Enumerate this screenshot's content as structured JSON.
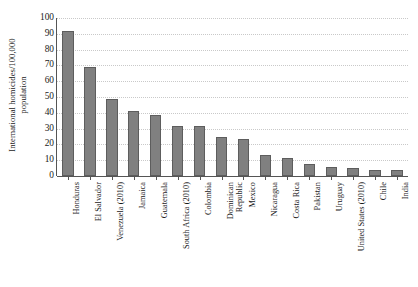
{
  "chart_data": {
    "type": "bar",
    "title": "",
    "subtitle": "",
    "xlabel": "",
    "ylabel": "International homicides/100,000 population",
    "ylabel_lines": [
      "International homicides/100,000",
      "population"
    ],
    "ylim": [
      0,
      100
    ],
    "yticks": [
      0,
      10,
      20,
      30,
      40,
      50,
      60,
      70,
      80,
      90,
      100
    ],
    "ytick_labels": [
      "0",
      "10",
      "20",
      "30",
      "40",
      "50",
      "60",
      "70",
      "80",
      "90",
      "100"
    ],
    "grid": true,
    "grid_style": "dotted-horizontal",
    "legend": false,
    "legend_position": "none",
    "orientation": "vertical",
    "bar_color": "#808080",
    "bar_border_color": "#5d5d5d",
    "categories": [
      "Honduras",
      "El Salvador",
      "Venezuela (2010)",
      "Jamaica",
      "Guatemala",
      "South Africa (2010)",
      "Colombia",
      "Dominican Republic",
      "Mexico",
      "Nicaragua",
      "Costa Rica",
      "Pakistan",
      "Uruguay",
      "United States (2010)",
      "Chile",
      "India"
    ],
    "category_label_lines": [
      [
        "Honduras"
      ],
      [
        "El Salvador"
      ],
      [
        "Venezuela (2010)"
      ],
      [
        "Jamaica"
      ],
      [
        "Guatemala"
      ],
      [
        "South Africa (2010)"
      ],
      [
        "Colombia"
      ],
      [
        "Dominican",
        "Republic"
      ],
      [
        "Mexico"
      ],
      [
        "Nicaragua"
      ],
      [
        "Costa Rica"
      ],
      [
        "Pakistan"
      ],
      [
        "Uruguay"
      ],
      [
        "United States (2010)"
      ],
      [
        "Chile"
      ],
      [
        "India"
      ]
    ],
    "values": [
      91.6,
      69.2,
      49.0,
      41.2,
      38.5,
      31.8,
      31.4,
      25.0,
      23.7,
      13.6,
      11.3,
      7.8,
      5.9,
      4.8,
      3.7,
      3.5
    ]
  }
}
